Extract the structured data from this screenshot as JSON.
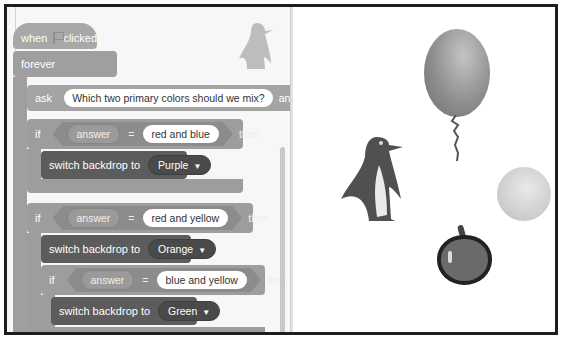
{
  "code_area": {
    "hat_block": {
      "prefix": "when",
      "icon": "green-flag-icon",
      "suffix": "clicked"
    },
    "forever_block": {
      "label": "forever"
    },
    "ask_block": {
      "label": "ask",
      "question": "Which two primary colors should we mix?",
      "suffix": "and wait"
    },
    "if_blocks": [
      {
        "keyword": "if",
        "variable": "answer",
        "operator": "=",
        "value": "red and blue",
        "then": "then",
        "action": {
          "label": "switch backdrop to",
          "option": "Purple"
        }
      },
      {
        "keyword": "if",
        "variable": "answer",
        "operator": "=",
        "value": "red and yellow",
        "then": "then",
        "action": {
          "label": "switch backdrop to",
          "option": "Orange"
        }
      },
      {
        "keyword": "if",
        "variable": "answer",
        "operator": "=",
        "value": "blue and yellow",
        "then": "then",
        "action": {
          "label": "switch backdrop to",
          "option": "Green"
        }
      }
    ],
    "sprite_thumbnail": "penguin-icon"
  },
  "stage": {
    "sprites": [
      "penguin",
      "balloon",
      "ball",
      "apple"
    ]
  },
  "colors": {
    "event_block": "#a8a8a8",
    "control_block": "#9d9d9d",
    "looks_block": "#5c5c5c",
    "frame_border": "#1e1e1e"
  }
}
